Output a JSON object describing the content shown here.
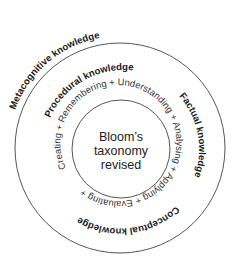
{
  "diagram": {
    "center": {
      "lines": [
        "Bloom’s",
        "taxonomy",
        "revised"
      ]
    },
    "cognitive_process_ring": "Creating + Remembering + Understanding + Analysing + Applying + Evaluating +",
    "knowledge_dimensions": {
      "metacognitive": "Metacognitive knowledge",
      "procedural": "Procedural knowledge",
      "factual": "Factual knowledge",
      "conceptual": "Conceptual knowledge"
    }
  }
}
